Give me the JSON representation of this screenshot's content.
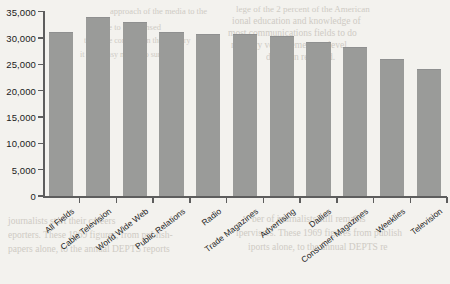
{
  "chart_data": {
    "type": "bar",
    "title": "",
    "xlabel": "",
    "ylabel": "",
    "ylim": [
      0,
      35000
    ],
    "ytick_step": 5000,
    "grid": false,
    "legend": "none",
    "bar_color": "#9a9b99",
    "background_color": "#f3f2ee",
    "axis_color": "#5d5d5d",
    "categories": [
      "All Fields",
      "Cable Television",
      "World Wide Web",
      "Public Relations",
      "Radio",
      "Trade Magazines",
      "Advertising",
      "Dailies",
      "Consumer Magazines",
      "Weeklies",
      "Television"
    ],
    "values": [
      30900,
      33700,
      32800,
      30900,
      30500,
      30500,
      30100,
      29100,
      28000,
      25800,
      23900
    ],
    "ytick_labels": [
      "0",
      "5,000",
      "10,000",
      "15,000",
      "20,000",
      "25,000",
      "30,000",
      "35,000"
    ],
    "ytick_values": [
      0,
      5000,
      10000,
      15000,
      20000,
      25000,
      30000,
      35000
    ]
  },
  "bleed_text": [
    {
      "text": "lege of the 2 percent of the American",
      "x": 236,
      "y": 4,
      "size": 9
    },
    {
      "text": "ional education and knowledge of",
      "x": 232,
      "y": 16,
      "size": 9.5
    },
    {
      "text": "most communications fields to do",
      "x": 228,
      "y": 28,
      "size": 9.5
    },
    {
      "text": "mentary very elementary level.",
      "x": 231,
      "y": 40,
      "size": 9.5
    },
    {
      "text": "ducation required.",
      "x": 266,
      "y": 52,
      "size": 9.5
    },
    {
      "text": "approach of the media to the",
      "x": 110,
      "y": 6,
      "size": 8.5
    },
    {
      "text": "have to be licensed",
      "x": 96,
      "y": 22,
      "size": 8.5
    },
    {
      "text": "the more common in the industry",
      "x": 84,
      "y": 36,
      "size": 8
    },
    {
      "text": "it is no easy matter to survive",
      "x": 80,
      "y": 50,
      "size": 8
    },
    {
      "text": "journalists start their careers",
      "x": 8,
      "y": 216,
      "size": 9.5
    },
    {
      "text": "eporters. These 1969 figures, from publish-",
      "x": 8,
      "y": 230,
      "size": 9.5
    },
    {
      "text": "papers alone, to the annual DEPTS reports",
      "x": 8,
      "y": 244,
      "size": 9.5
    },
    {
      "text": "ber of journalists still remains",
      "x": 252,
      "y": 214,
      "size": 9.5
    },
    {
      "text": "ipervisors. These 1969 figures from publish",
      "x": 236,
      "y": 228,
      "size": 9.5
    },
    {
      "text": "iports alone, to the annual DEPTS re",
      "x": 248,
      "y": 242,
      "size": 9.5
    }
  ]
}
